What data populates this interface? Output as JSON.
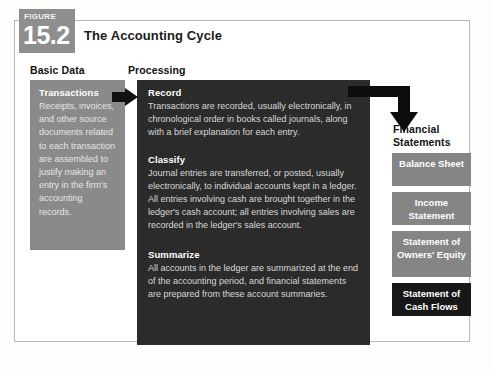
{
  "figure": {
    "label": "FIGURE",
    "number": "15.2",
    "title": "The Accounting Cycle"
  },
  "columns": {
    "basic_data_heading": "Basic Data",
    "processing_heading": "Processing",
    "financial_heading": "Financial Statements"
  },
  "basic_data": {
    "heading": "Transactions",
    "body": "Receipts, invoices, and other source documents related to each transaction are assembled to justify making an entry in the firm's accounting records."
  },
  "processing": {
    "sections": [
      {
        "heading": "Record",
        "body": "Transactions are recorded, usually electronically, in chronological order in books called journals, along with a brief explanation for each entry."
      },
      {
        "heading": "Classify",
        "body": "Journal entries are transferred, or posted, usually electronically, to individual accounts kept in a ledger. All entries involving cash are brought together in the ledger's cash account; all entries involving sales are recorded in the ledger's sales account."
      },
      {
        "heading": "Summarize",
        "body": "All accounts in the ledger are summarized at the end of the accounting period, and financial statements are prepared from these account summaries."
      }
    ]
  },
  "financial_statements": {
    "items": [
      {
        "label": "Balance Sheet"
      },
      {
        "label": "Income Statement"
      },
      {
        "label": "Statement of Owners' Equity"
      },
      {
        "label": "Statement of Cash Flows"
      }
    ]
  },
  "icons": {
    "arrow_right": "arrow-right-icon",
    "arrow_elbow_down": "arrow-elbow-down-icon"
  },
  "colors": {
    "badge_gray": "#8e8e8e",
    "panel_gray": "#8a8a8a",
    "panel_dark": "#2b2b2b",
    "box_gray": "#858585",
    "box_black": "#181818",
    "frame_border": "#b9b9b4",
    "page_background": "#ffffff"
  }
}
